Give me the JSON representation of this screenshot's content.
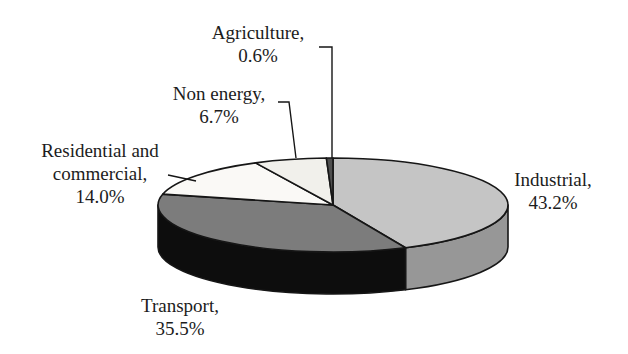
{
  "page": {
    "background": "#ffffff"
  },
  "chart_data": {
    "type": "pie",
    "style": "3d",
    "title": "",
    "unit": "%",
    "start_angle_deg": 90,
    "direction": "clockwise",
    "legend": "none",
    "categories": [
      "Industrial",
      "Transport",
      "Residential and commercial",
      "Non energy",
      "Agriculture"
    ],
    "values": [
      43.2,
      35.5,
      14.0,
      6.7,
      0.6
    ],
    "slices": [
      {
        "name": "Industrial",
        "value_pct": 43.2,
        "label_lines": [
          "Industrial,",
          "43.2%"
        ],
        "top_color": "#c5c5c5",
        "side_color": "#979797"
      },
      {
        "name": "Transport",
        "value_pct": 35.5,
        "label_lines": [
          "Transport,",
          "35.5%"
        ],
        "top_color": "#7c7c7c",
        "side_color": "#0d0d0d"
      },
      {
        "name": "Residential and commercial",
        "value_pct": 14.0,
        "label_lines": [
          "Residential and",
          "commercial,",
          "14.0%"
        ],
        "top_color": "#faf9f6",
        "side_color": "#d8d7d3"
      },
      {
        "name": "Non energy",
        "value_pct": 6.7,
        "label_lines": [
          "Non energy,",
          "6.7%"
        ],
        "top_color": "#f1f0eb",
        "side_color": "#d0cfca"
      },
      {
        "name": "Agriculture",
        "value_pct": 0.6,
        "label_lines": [
          "Agriculture,",
          "0.6%"
        ],
        "top_color": "#4f4f4f",
        "side_color": "#2b2b2b"
      }
    ],
    "label_color": "#1c1c1c",
    "outline_color": "#161616"
  }
}
